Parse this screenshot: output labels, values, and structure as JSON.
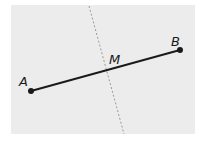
{
  "diagram": {
    "type": "geometry-segment-perpendicular-bisector",
    "points": {
      "A": {
        "label": "A",
        "x": 31,
        "y": 91
      },
      "B": {
        "label": "B",
        "x": 180,
        "y": 50
      },
      "M": {
        "label": "M"
      }
    },
    "segment": {
      "from": "A",
      "to": "B",
      "style": "solid"
    },
    "bisector": {
      "style": "dashed",
      "x1": 89,
      "y1": 6,
      "x2": 124,
      "y2": 134
    },
    "colors": {
      "background": "#ececec",
      "line": "#1a1a1a",
      "dashed": "#9a9a9a"
    }
  }
}
